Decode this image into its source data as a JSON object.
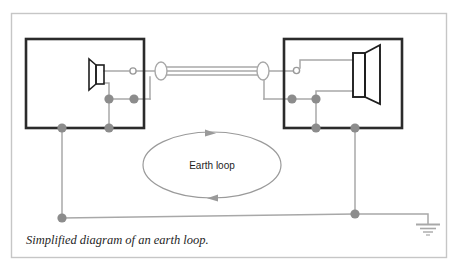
{
  "figure": {
    "caption": "Simplified diagram of an earth loop.",
    "loop_label": "Earth loop",
    "frame_color": "#c9c9c9",
    "background": "#ffffff",
    "equipment_box_color": "#2b2b2b",
    "wire_color": "#a8a8a8",
    "node_color": "#8c8c8c",
    "loop_color": "#9a9a9a",
    "speaker_color": "#1f1f1f"
  },
  "diagram": {
    "type": "schematic",
    "title": "Simplified diagram of an earth loop.",
    "left_unit": {
      "name": "source-equipment-chassis",
      "speaker_name": "left-speaker",
      "signal_terminal": "open-terminal",
      "ground_terminals": 2
    },
    "right_unit": {
      "name": "destination-equipment-chassis",
      "speaker_name": "right-speaker",
      "signal_terminal": "open-terminal",
      "ground_terminals": 2
    },
    "interconnect": {
      "name": "screened-signal-cable",
      "left_connector": "cable-connector-left",
      "right_connector": "cable-connector-right",
      "conductors": 2
    },
    "earth": {
      "name": "earth-ground-symbol",
      "bars": 4
    },
    "loop": {
      "label": "Earth loop",
      "arrow_top_direction": "right",
      "arrow_bottom_direction": "left"
    }
  }
}
